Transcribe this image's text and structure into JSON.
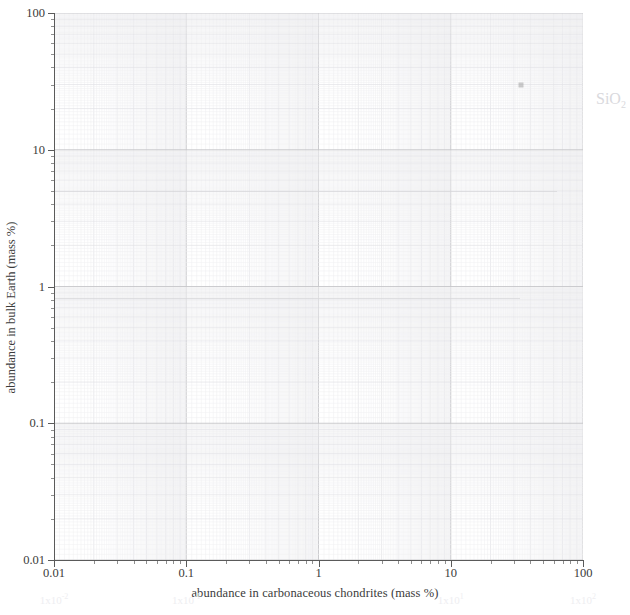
{
  "chart_data": {
    "type": "scatter",
    "title": "",
    "xlabel": "abundance in carbonaceous chondrites (mass %)",
    "ylabel": "abundance in bulk Earth (mass %)",
    "xscale": "log",
    "yscale": "log",
    "xlim": [
      0.01,
      100
    ],
    "ylim": [
      0.01,
      100
    ],
    "grid": true,
    "grid_style": "log-log graph paper (major + minor decade subdivisions)",
    "legend": "none",
    "xticks": [
      "0.01",
      "0.1",
      "1",
      "10",
      "100"
    ],
    "xtick_values": [
      0.01,
      0.1,
      1,
      10,
      100
    ],
    "yticks": [
      "0.01",
      "0.1",
      "1",
      "10",
      "100"
    ],
    "ytick_values": [
      0.01,
      0.1,
      1,
      10,
      100
    ],
    "points": [
      {
        "label": "SiO2",
        "x": 34,
        "y": 30,
        "marker": "square",
        "faint": true
      }
    ],
    "annotations": [
      {
        "text": "SiO",
        "sub": "2",
        "x_px": 596,
        "y_px": 90,
        "faint": true,
        "outside_axes": true
      }
    ],
    "ghost_axis_labels": [
      {
        "text": "1x10",
        "sup": "-2",
        "x_value": 0.01
      },
      {
        "text": "1x10",
        "sup": "-1",
        "x_value": 0.1
      },
      {
        "text": "1x10",
        "sup": "1",
        "x_value": 10
      },
      {
        "text": "1x10",
        "sup": "2",
        "x_value": 100
      }
    ]
  },
  "colors": {
    "background": "#ffffff",
    "axis": "#5a5a5a",
    "major_grid": "#c6c6ca",
    "minor_grid": "#e2e2e6",
    "subminor_grid": "#eeeef1",
    "label": "#3b3b3b",
    "point": "#9a9a9a",
    "ghost": "#eeeef1",
    "annotation": "#d9d9dd"
  }
}
